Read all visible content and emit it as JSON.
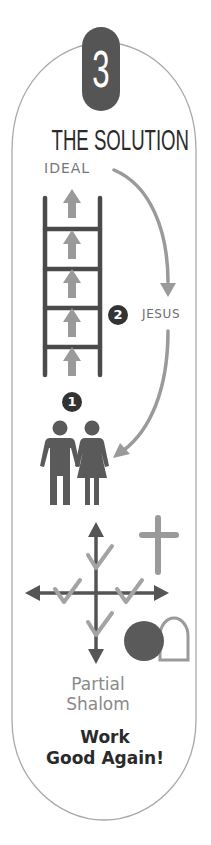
{
  "step": {
    "number": "3",
    "title": "THE SOLUTION"
  },
  "labels": {
    "ideal": "IDEAL",
    "jesus": "JESUS",
    "marker_1": "1",
    "marker_2": "2",
    "partial_line1": "Partial",
    "partial_line2": "Shalom",
    "work_line1": "Work",
    "work_line2": "Good Again!"
  },
  "icons": {
    "ladder": "ladder-icon",
    "up_arrows": "arrow-up-icon",
    "curved_arrow_to_jesus": "curved-arrow-icon",
    "curved_arrow_to_people": "curved-arrow-icon",
    "couple": "couple-icon",
    "compass_arrows": "four-way-arrow-icon",
    "checkmarks": "checkmark-icon",
    "cross": "cross-icon",
    "empty_tomb": "tomb-icon"
  },
  "colors": {
    "dark": "#555555",
    "darker": "#333333",
    "accent_gray": "#9a9a9a",
    "outline": "#a8a8a8",
    "text_dark": "#2a2a2a",
    "text_light": "#8a8a8a"
  }
}
